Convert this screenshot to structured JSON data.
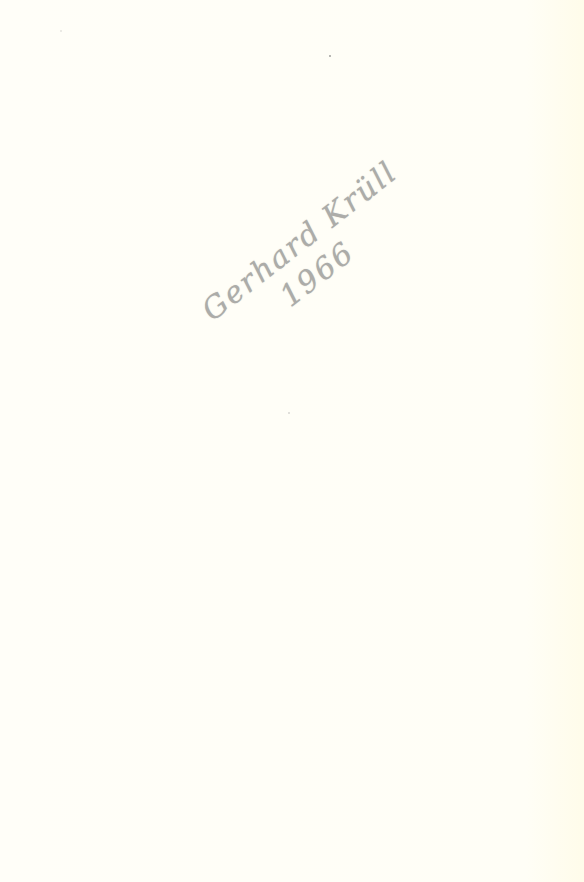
{
  "page": {
    "type": "blank-scanned-page",
    "background_color": "#fffef6"
  },
  "handwriting": {
    "line1": "Gerhard Krüll",
    "line2": "1966",
    "ink_color": "#6a6a6a",
    "orientation": "diagonal"
  }
}
